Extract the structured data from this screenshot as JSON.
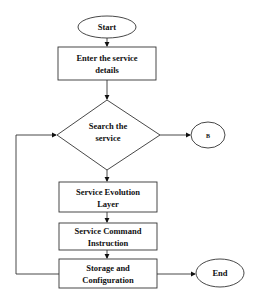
{
  "diagram": {
    "type": "flowchart",
    "nodes": {
      "start": {
        "shape": "ellipse",
        "label": "Start"
      },
      "enter": {
        "shape": "rectangle",
        "line1": "Enter the service",
        "line2": "details"
      },
      "search": {
        "shape": "diamond",
        "line1": "Search the",
        "line2": "service"
      },
      "b": {
        "shape": "ellipse",
        "label": "B"
      },
      "evolution": {
        "shape": "rectangle",
        "line1": "Service Evolution",
        "line2": "Layer"
      },
      "command": {
        "shape": "rectangle",
        "line1": "Service Command",
        "line2": "Instruction"
      },
      "storage": {
        "shape": "rectangle",
        "line1": "Storage and",
        "line2": "Configuration"
      },
      "end": {
        "shape": "ellipse",
        "label": "End"
      }
    },
    "edges": [
      {
        "from": "start",
        "to": "enter"
      },
      {
        "from": "enter",
        "to": "search"
      },
      {
        "from": "search",
        "to": "b"
      },
      {
        "from": "search",
        "to": "evolution"
      },
      {
        "from": "evolution",
        "to": "command"
      },
      {
        "from": "command",
        "to": "storage"
      },
      {
        "from": "storage",
        "to": "end"
      },
      {
        "from": "storage",
        "to": "search",
        "note": "loop back"
      }
    ],
    "colors": {
      "stroke": "#333333",
      "fill": "#ffffff",
      "text": "#111111"
    }
  }
}
